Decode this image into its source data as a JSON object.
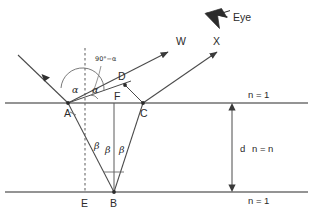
{
  "figure": {
    "background_color": "#ffffff",
    "line_color": "#4a4a4a",
    "text_color": "#2b2b2b"
  },
  "points": [
    {
      "id": "A",
      "label": "A",
      "x": 68,
      "y": 103,
      "label_x": 64,
      "label_y": 117
    },
    {
      "id": "B",
      "label": "B",
      "x": 114,
      "y": 192,
      "label_x": 110,
      "label_y": 207
    },
    {
      "id": "C",
      "label": "C",
      "x": 143,
      "y": 103,
      "label_x": 140,
      "label_y": 117
    },
    {
      "id": "D",
      "label": "D",
      "x": 125,
      "y": 85,
      "label_x": 118,
      "label_y": 80
    },
    {
      "id": "E",
      "label": "E",
      "x": 85,
      "y": 192,
      "label_x": 81,
      "label_y": 207
    },
    {
      "id": "F",
      "label": "F",
      "x": 114,
      "y": 103,
      "label_x": 115,
      "label_y": 100
    }
  ],
  "rays": [
    {
      "name": "incident-ray",
      "label": "",
      "from": [
        18,
        55
      ],
      "to": [
        68,
        103
      ]
    },
    {
      "name": "reflected-ray-w",
      "label": "W",
      "from": [
        68,
        103
      ],
      "to": [
        163,
        55
      ],
      "label_x": 177,
      "label_y": 46
    },
    {
      "name": "transmitted-ray-x",
      "label": "X",
      "from": [
        143,
        103
      ],
      "to": [
        212,
        55
      ],
      "label_x": 214,
      "label_y": 46
    }
  ],
  "angles": [
    {
      "name": "alpha-incident",
      "label": "α",
      "x": 76,
      "y": 89
    },
    {
      "name": "alpha-reflected",
      "label": "α",
      "x": 96,
      "y": 89
    },
    {
      "name": "ninety-minus-alpha",
      "label": "90°−α",
      "x": 97,
      "y": 60
    },
    {
      "name": "beta-left",
      "label": "β",
      "x": 97,
      "y": 146
    },
    {
      "name": "beta-middle",
      "label": "β",
      "x": 108,
      "y": 151
    },
    {
      "name": "beta-right",
      "label": "β",
      "x": 122,
      "y": 151
    }
  ],
  "media_labels": [
    {
      "name": "refractive-index-top",
      "text": "n = 1",
      "x": 250,
      "y": 98
    },
    {
      "name": "film-thickness",
      "text": "d",
      "x": 243,
      "y": 152
    },
    {
      "name": "refractive-index-film",
      "text": "n = n",
      "x": 255,
      "y": 152
    },
    {
      "name": "refractive-index-bottom",
      "text": "n = 1",
      "x": 250,
      "y": 204
    }
  ],
  "eye": {
    "label": "Eye",
    "label_x": 237,
    "label_y": 22,
    "icon": "eye-arrow-icon",
    "icon_x": 205,
    "icon_y": 8
  },
  "boundaries": {
    "top_y": 103,
    "bottom_y": 192,
    "x_start": 5,
    "x_end": 308
  },
  "normal_line": {
    "name": "normal-dashed-line",
    "x": 85,
    "y_top": 48,
    "y_bottom": 192
  },
  "thickness_arrow": {
    "name": "thickness-dimension-arrow",
    "x": 232,
    "y_top": 103,
    "y_bottom": 192
  }
}
